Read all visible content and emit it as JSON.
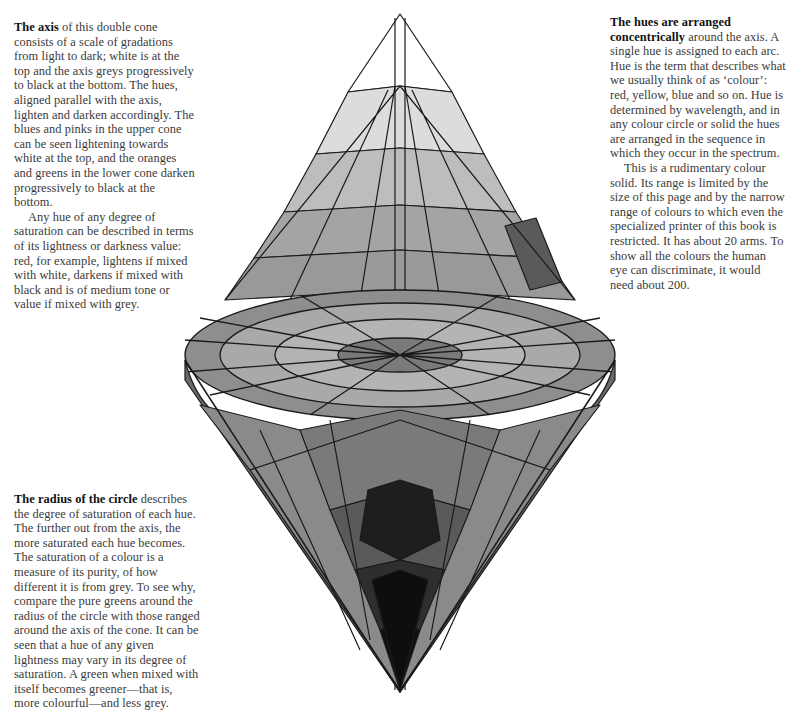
{
  "captions": {
    "axis": {
      "lead": "The axis",
      "body": " of this double cone consists of a scale of gradations from light to dark; white is at the top and the axis greys progressively to black at the bottom. The hues, aligned parallel with the axis, lighten and darken accordingly. The blues and pinks in the upper cone can be seen lightening towards white at the top, and the oranges and greens in the lower cone darken progressively to black at the bottom.",
      "para2": "Any hue of any degree of saturation can be described in terms of its lightness or darkness value: red, for example, lightens if mixed with white, darkens if mixed with black and is of medium tone or value if mixed with grey."
    },
    "hues": {
      "lead": "The hues are arranged concentrically",
      "body": " around the axis. A single hue is assigned to each arc. Hue is the term that describes what we usually think of as ‘colour’: red, yellow, blue and so on. Hue is determined by wavelength, and in any colour circle or solid the hues are arranged in the sequence in which they occur in the spectrum.",
      "para2": "This is a rudimentary colour solid. Its range is limited by the size of this page and by the narrow range of colours to which even the specialized printer of this book is restricted. It has about 20 arms. To show all the colours the human eye can discriminate, it would need about 200."
    },
    "radius": {
      "lead": "The radius of the circle",
      "body": " describes the degree of saturation of each hue. The further out from the axis, the more saturated each hue becomes. The saturation of a colour is a measure of its purity, of how different it is from grey. To see why, compare the pure greens around the radius of the circle with those ranged around the axis of the cone. It can be seen that a hue of any given lightness may vary in its degree of saturation. A green when mixed with itself becomes greener—that is, more colourful—and less grey."
    }
  },
  "illustration": {
    "subject": "double-cone colour solid",
    "colors": {
      "white_tip": "#ffffff",
      "light": "#d8d8d8",
      "mid_light": "#bdbdbd",
      "mid": "#9e9e9e",
      "mid_dark": "#7d7d7d",
      "dark": "#555555",
      "black": "#111111",
      "outline": "#1a1a1a"
    }
  }
}
